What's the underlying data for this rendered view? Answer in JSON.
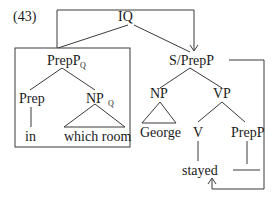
{
  "example_number": "(43)",
  "nodes": {
    "root": "IQ",
    "preppq": {
      "base": "PrepP",
      "sub": "Q"
    },
    "prep": "Prep",
    "npq": {
      "base": "NP",
      "sub": "Q"
    },
    "in": "in",
    "which_room": "which room",
    "s_prepp": "S/PrepP",
    "np": "NP",
    "george": "George",
    "vp": "VP",
    "v": "V",
    "stayed": "stayed",
    "prepp": "PrepP"
  }
}
